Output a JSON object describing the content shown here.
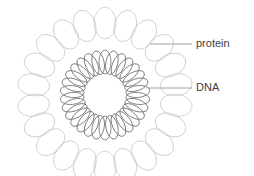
{
  "figure": {
    "type": "biological-diagram",
    "background_color": "#ffffff",
    "width": 254,
    "height": 176
  },
  "structures": {
    "outer_ring": {
      "name": "protein",
      "semantic": "histone-protein-shell",
      "center_x": 105,
      "center_y": 95,
      "ring_radius": 72,
      "unit_count": 22,
      "unit_radius_x": 11,
      "unit_radius_y": 16,
      "stroke_color": "#c2c2c2",
      "stroke_width": 0.7
    },
    "inner_ring": {
      "name": "DNA",
      "semantic": "dna-coil",
      "center_x": 105,
      "center_y": 95,
      "ring_radius": 33,
      "unit_count": 30,
      "unit_radius_x": 6,
      "unit_radius_y": 12,
      "stroke_color": "#6e6e6e",
      "stroke_width": 0.8
    }
  },
  "labels": [
    {
      "id": "protein",
      "text": "protein",
      "text_x": 196,
      "text_y": 44,
      "leader_x1": 150,
      "leader_y1": 44,
      "leader_x2": 192,
      "leader_y2": 44,
      "anchor_x": 150,
      "anchor_y": 44,
      "color": "#404040",
      "leader_color": "#8a8a8a"
    },
    {
      "id": "dna",
      "text": "DNA",
      "text_x": 196,
      "text_y": 88,
      "leader_x1": 148,
      "leader_y1": 88,
      "leader_x2": 192,
      "leader_y2": 88,
      "anchor_x": 148,
      "anchor_y": 88,
      "color": "#404040",
      "leader_color": "#8a8a8a"
    }
  ]
}
